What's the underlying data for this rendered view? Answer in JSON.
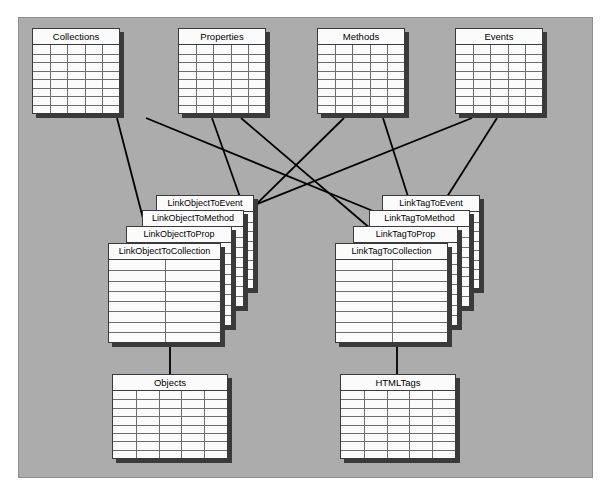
{
  "diagram": {
    "background_color": "#acacac",
    "frame_border_color": "#8e8e8e",
    "table_fill_color": "#fbfbfb",
    "table_border_color": "#3a3a3a",
    "grid_line_color": "#6d6d6d",
    "connector_color": "#000000"
  },
  "entities": {
    "top": [
      {
        "name": "Collections",
        "columns": 5,
        "rows": 8
      },
      {
        "name": "Properties",
        "columns": 5,
        "rows": 8
      },
      {
        "name": "Methods",
        "columns": 5,
        "rows": 8
      },
      {
        "name": "Events",
        "columns": 5,
        "rows": 8
      }
    ],
    "left_stack": [
      {
        "name": "LinkObjectToEvent",
        "columns": 2,
        "rows": 8
      },
      {
        "name": "LinkObjectToMethod",
        "columns": 2,
        "rows": 8
      },
      {
        "name": "LinkObjectToProp",
        "columns": 2,
        "rows": 8
      },
      {
        "name": "LinkObjectToCollection",
        "columns": 2,
        "rows": 8
      }
    ],
    "right_stack": [
      {
        "name": "LinkTagToEvent",
        "columns": 2,
        "rows": 8
      },
      {
        "name": "LinkTagToMethod",
        "columns": 2,
        "rows": 8
      },
      {
        "name": "LinkTagToProp",
        "columns": 2,
        "rows": 8
      },
      {
        "name": "LinkTagToCollection",
        "columns": 2,
        "rows": 8
      }
    ],
    "bottom": [
      {
        "name": "Objects",
        "columns": 5,
        "rows": 8
      },
      {
        "name": "HTMLTags",
        "columns": 5,
        "rows": 8
      }
    ]
  },
  "relationships": [
    {
      "from": "Collections",
      "to": "LinkObjectToCollection"
    },
    {
      "from": "Collections",
      "to": "LinkTagToCollection"
    },
    {
      "from": "Properties",
      "to": "LinkObjectToProp"
    },
    {
      "from": "Properties",
      "to": "LinkTagToProp"
    },
    {
      "from": "Methods",
      "to": "LinkObjectToMethod"
    },
    {
      "from": "Methods",
      "to": "LinkTagToMethod"
    },
    {
      "from": "Events",
      "to": "LinkObjectToEvent"
    },
    {
      "from": "Events",
      "to": "LinkTagToEvent"
    },
    {
      "from": "LinkObjectToCollection",
      "to": "Objects"
    },
    {
      "from": "LinkTagToCollection",
      "to": "HTMLTags"
    }
  ]
}
